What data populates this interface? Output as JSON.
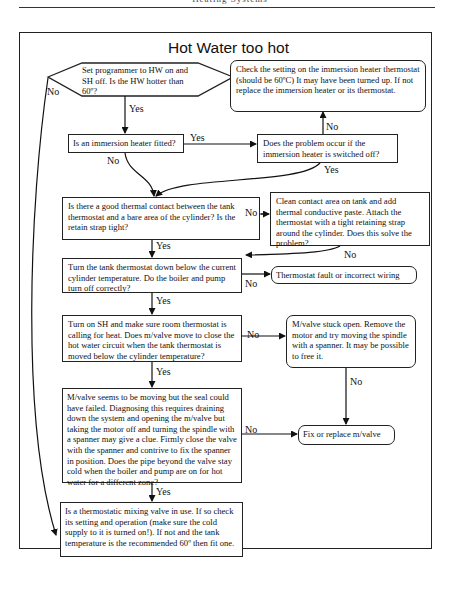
{
  "page_header": "Heating Systems",
  "title": "Hot Water too hot",
  "nodes": {
    "start": "Set programmer to HW on and SH off. Is the HW hotter than 60º?",
    "immersion_fitted": "Is an immersion heater fitted?",
    "immersion_off": "Does the problem occur if the immersion heater is switched off?",
    "check_immersion": "Check the setting on the immersion heater thermostat (should be 60ºC) It may have been turned up. If not replace the immersion heater or its thermostat.",
    "thermal_contact": "Is there a good thermal contact between the tank thermostat and a bare area of the cylinder? Is the retain strap tight?",
    "clean_contact": "Clean contact area on tank and add thermal conductive paste. Attach the thermostat with a tight retaining strap around the cylinder. Does this solve the problem?",
    "turn_down": "Turn the tank thermostat down below the current cylinder temperature. Do the boiler and pump turn off correctly?",
    "thermostat_fault": "Thermostat fault or incorrect wiring",
    "turn_on_sh": "Turn on SH and make sure room thermostat is calling for heat. Does m/valve move to close the hot water circuit when the tank thermostat is moved below the cylinder temperature?",
    "mvalve_stuck": "M/valve stuck open. Remove the motor and try moving the spindle with a spanner. It may be possible to free it.",
    "mvalve_seal": "M/valve seems to be moving but the seal could have failed. Diagnosing this requires draining down the system and opening the m/valve but taking the motor off and turning the spindle with a spanner may give a clue. Firmly close the valve with the spanner and contrive to fix the spanner in position. Does the pipe beyond the valve stay cold when the boiler and pump are on for hot water for a different zone?",
    "fix_replace": "Fix or replace m/valve",
    "mixing_valve": "Is a thermostatic mixing valve in use. If so check its setting and operation (make sure the cold supply to it is turned on!). If not and the tank temperature is the recommended 60º then fit one."
  },
  "edge_labels": {
    "start_yes": "Yes",
    "start_no": "No",
    "fitted_yes": "Yes",
    "fitted_no": "No",
    "off_no": "No",
    "off_yes": "Yes",
    "contact_no": "No",
    "contact_yes": "Yes",
    "clean_no": "No",
    "turndown_no": "No",
    "turndown_yes": "Yes",
    "sh_no": "No",
    "sh_yes": "Yes",
    "stuck_no": "No",
    "seal_no": "No",
    "seal_yes": "Yes"
  }
}
